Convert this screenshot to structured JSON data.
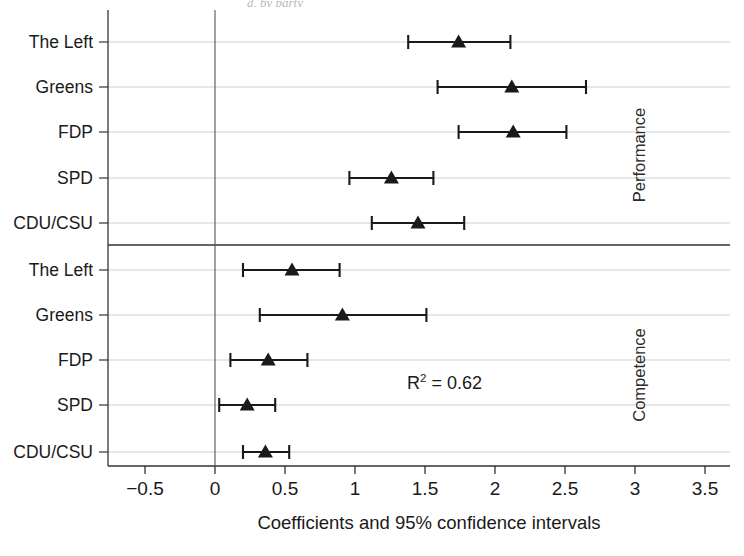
{
  "figure": {
    "background": "#ffffff",
    "ink_color": "#1a1a1a",
    "grid_color": "#c9c9c9",
    "axis_color": "#333333",
    "marker_shape": "triangle-up",
    "top_partial_caption": "d, by party"
  },
  "axis": {
    "x_title": "Coefficients and 95% confidence intervals",
    "x_ticks": [
      "−0.5",
      "0",
      "0.5",
      "1",
      "1.5",
      "2",
      "2.5",
      "3",
      "3.5"
    ],
    "x_tick_values": [
      -0.5,
      0,
      0.5,
      1,
      1.5,
      2,
      2.5,
      3,
      3.5
    ],
    "x_min": -0.5,
    "x_max": 3.5,
    "zero_reference_line": 0
  },
  "annotations": [
    {
      "name": "r-squared",
      "text_prefix": "R",
      "superscript": "2",
      "text_suffix": " = 0.62",
      "value": 0.62,
      "x": 1.64,
      "y_row": "competence-fdp-to-spd"
    }
  ],
  "panels": [
    {
      "id": "performance",
      "label": "Performance",
      "rows": [
        {
          "category": "The Left",
          "estimate": 1.74,
          "ci_low": 1.38,
          "ci_high": 2.11
        },
        {
          "category": "Greens",
          "estimate": 2.12,
          "ci_low": 1.59,
          "ci_high": 2.65
        },
        {
          "category": "FDP",
          "estimate": 2.13,
          "ci_low": 1.74,
          "ci_high": 2.51
        },
        {
          "category": "SPD",
          "estimate": 1.26,
          "ci_low": 0.96,
          "ci_high": 1.56
        },
        {
          "category": "CDU/CSU",
          "estimate": 1.45,
          "ci_low": 1.12,
          "ci_high": 1.78
        }
      ]
    },
    {
      "id": "competence",
      "label": "Competence",
      "rows": [
        {
          "category": "The Left",
          "estimate": 0.55,
          "ci_low": 0.2,
          "ci_high": 0.89
        },
        {
          "category": "Greens",
          "estimate": 0.91,
          "ci_low": 0.32,
          "ci_high": 1.51
        },
        {
          "category": "FDP",
          "estimate": 0.38,
          "ci_low": 0.11,
          "ci_high": 0.66
        },
        {
          "category": "SPD",
          "estimate": 0.23,
          "ci_low": 0.03,
          "ci_high": 0.43
        },
        {
          "category": "CDU/CSU",
          "estimate": 0.36,
          "ci_low": 0.2,
          "ci_high": 0.53
        }
      ]
    }
  ],
  "chart_data": {
    "type": "scatter",
    "title": "",
    "subtitle": "",
    "xlabel": "Coefficients and 95% confidence intervals",
    "ylabel": "",
    "xlim": [
      -0.5,
      3.5
    ],
    "xticks": [
      -0.5,
      0,
      0.5,
      1,
      1.5,
      2,
      2.5,
      3,
      3.5
    ],
    "xticklabels": [
      "−0.5",
      "0",
      "0.5",
      "1",
      "1.5",
      "2",
      "2.5",
      "3",
      "3.5"
    ],
    "grid": true,
    "grid_axis": "y",
    "legend": null,
    "orientation": "horizontal",
    "error_bars": "95% confidence intervals",
    "reference_line_x": 0,
    "panel_labels": [
      "Performance",
      "Competence"
    ],
    "categories": [
      "Performance: The Left",
      "Performance: Greens",
      "Performance: FDP",
      "Performance: SPD",
      "Performance: CDU/CSU",
      "Competence: The Left",
      "Competence: Greens",
      "Competence: FDP",
      "Competence: SPD",
      "Competence: CDU/CSU"
    ],
    "values": [
      1.74,
      2.12,
      2.13,
      1.26,
      1.45,
      0.55,
      0.91,
      0.38,
      0.23,
      0.36
    ],
    "ci_low": [
      1.38,
      1.59,
      1.74,
      0.96,
      1.12,
      0.2,
      0.32,
      0.11,
      0.03,
      0.2
    ],
    "ci_high": [
      2.11,
      2.65,
      2.51,
      1.56,
      1.78,
      0.89,
      1.51,
      0.66,
      0.43,
      0.53
    ],
    "annotations": [
      "R² = 0.62"
    ]
  }
}
